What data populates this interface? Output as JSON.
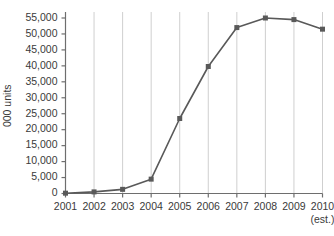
{
  "chart_data": {
    "type": "line",
    "title": "",
    "subtitle": "",
    "xlabel": "",
    "ylabel": "000 units",
    "categories": [
      "2001",
      "2002",
      "2003",
      "2004",
      "2005",
      "2006",
      "2007",
      "2008",
      "2009",
      "2010"
    ],
    "values": [
      100,
      500,
      1300,
      4500,
      23500,
      39800,
      52000,
      55000,
      54500,
      51500
    ],
    "series": [
      {
        "name": "units",
        "values": [
          100,
          500,
          1300,
          4500,
          23500,
          39800,
          52000,
          55000,
          54500,
          51500
        ]
      }
    ],
    "ylim": [
      0,
      55000
    ],
    "ytick_step": 5000,
    "ytick_labels": [
      "0",
      "5,000",
      "10,000",
      "15,000",
      "20,000",
      "25,000",
      "30,000",
      "35,000",
      "40,000",
      "45,000",
      "50,000",
      "55,000"
    ],
    "ytick_values": [
      0,
      5000,
      10000,
      15000,
      20000,
      25000,
      30000,
      35000,
      40000,
      45000,
      50000,
      55000
    ],
    "xtick_labels": [
      "2001",
      "2002",
      "2003",
      "2004",
      "2005",
      "2006",
      "2007",
      "2008",
      "2009",
      "2010"
    ],
    "xtick_sublabels": [
      "",
      "",
      "",
      "",
      "",
      "",
      "",
      "",
      "",
      "(est.)"
    ],
    "grid": {
      "vertical": true,
      "horizontal": false,
      "color": "#cfcfcf"
    },
    "legend": {
      "visible": false,
      "position": "none",
      "entries": []
    },
    "marker": {
      "shape": "square",
      "size": 5
    },
    "colors": {
      "line": "#595959",
      "marker": "#595959",
      "axis": "#6e6e6e",
      "grid": "#cfcfcf",
      "text": "#3a3a3a",
      "background": "#ffffff"
    }
  }
}
